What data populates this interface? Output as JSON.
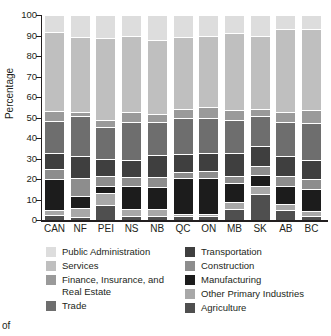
{
  "chart_data": {
    "type": "bar",
    "subtype": "stacked-100-percent",
    "title": "",
    "xlabel": "",
    "ylabel": "Percentage",
    "ylim": [
      0,
      100
    ],
    "yticks": [
      0,
      10,
      20,
      30,
      40,
      50,
      60,
      70,
      80,
      90,
      100
    ],
    "grid": false,
    "legend_position": "bottom",
    "categories": [
      "CAN",
      "NF",
      "PEI",
      "NS",
      "NB",
      "QC",
      "ON",
      "MB",
      "SK",
      "AB",
      "BC"
    ],
    "series": [
      {
        "name": "Agriculture",
        "color": "#4f4f4f",
        "values": [
          2.5,
          1.5,
          7.5,
          2.0,
          2.0,
          2.0,
          2.0,
          5.5,
          12.5,
          5.0,
          2.0
        ]
      },
      {
        "name": "Other Primary Industries",
        "color": "#a8a8a8",
        "values": [
          2.5,
          4.5,
          5.5,
          3.5,
          3.5,
          1.0,
          1.0,
          3.5,
          4.0,
          3.0,
          2.5
        ]
      },
      {
        "name": "Manufacturing",
        "color": "#1c1c1c",
        "values": [
          15.0,
          5.5,
          3.5,
          11.0,
          10.5,
          17.5,
          17.5,
          9.0,
          5.5,
          8.5,
          10.5
        ]
      },
      {
        "name": "Construction",
        "color": "#8d8d8d",
        "values": [
          5.0,
          9.0,
          5.0,
          4.5,
          5.0,
          3.0,
          3.5,
          3.5,
          4.5,
          5.0,
          5.0
        ]
      },
      {
        "name": "Transportation",
        "color": "#3f3f3f",
        "values": [
          7.5,
          10.5,
          8.5,
          8.5,
          10.5,
          8.5,
          8.5,
          11.0,
          9.5,
          9.5,
          9.5
        ]
      },
      {
        "name": "Trade",
        "color": "#6e6e6e",
        "values": [
          16.0,
          19.5,
          15.5,
          18.5,
          16.5,
          18.0,
          17.5,
          16.5,
          14.5,
          17.0,
          18.0
        ]
      },
      {
        "name": "Finance, Insurance, and Real Estate",
        "color": "#9a9a9a",
        "values": [
          4.5,
          2.0,
          3.5,
          4.5,
          3.5,
          4.0,
          5.0,
          4.5,
          3.5,
          4.5,
          6.0
        ]
      },
      {
        "name": "Services",
        "color": "#bfbfbf",
        "values": [
          38.5,
          37.0,
          40.0,
          37.5,
          36.5,
          35.5,
          35.0,
          37.5,
          36.0,
          40.5,
          39.5
        ]
      },
      {
        "name": "Public Administration",
        "color": "#dddddd",
        "values": [
          8.5,
          10.5,
          11.0,
          10.0,
          12.0,
          10.5,
          10.0,
          9.0,
          10.0,
          7.0,
          7.0
        ]
      }
    ]
  },
  "legend": {
    "left_column": [
      {
        "label": "Public Administration",
        "color": "#dddddd"
      },
      {
        "label": "Services",
        "color": "#bfbfbf"
      },
      {
        "label": "Finance, Insurance, and Real Estate",
        "color": "#9a9a9a"
      },
      {
        "label": "Trade",
        "color": "#6e6e6e"
      }
    ],
    "right_column": [
      {
        "label": "Transportation",
        "color": "#3f3f3f"
      },
      {
        "label": "Construction",
        "color": "#8d8d8d"
      },
      {
        "label": "Manufacturing",
        "color": "#1c1c1c"
      },
      {
        "label": "Other Primary Industries",
        "color": "#a8a8a8"
      },
      {
        "label": "Agriculture",
        "color": "#4f4f4f"
      }
    ]
  },
  "caption_fragment": "of"
}
